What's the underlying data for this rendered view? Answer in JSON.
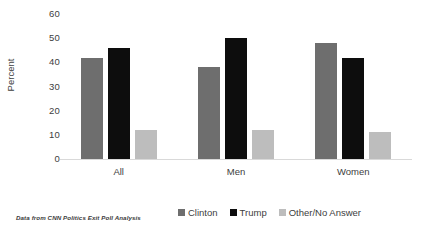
{
  "chart_data": {
    "type": "bar",
    "title": "",
    "subtitle": "",
    "xlabel": "",
    "ylabel": "Percent",
    "categories": [
      "All",
      "Men",
      "Women"
    ],
    "series": [
      {
        "name": "Clinton",
        "color": "#6e6e6e",
        "values": [
          42,
          38,
          48
        ]
      },
      {
        "name": "Trump",
        "color": "#0d0d0d",
        "values": [
          46,
          50,
          42
        ]
      },
      {
        "name": "Other/No Answer",
        "color": "#bdbdbd",
        "values": [
          12,
          12,
          11
        ]
      }
    ],
    "ylim": [
      0,
      60
    ],
    "yticks": [
      "0",
      "10",
      "20",
      "30",
      "40",
      "50",
      "60"
    ],
    "ytick_values": [
      0,
      10,
      20,
      30,
      40,
      50,
      60
    ],
    "grid": false,
    "legend_position": "bottom"
  },
  "source_note": "Data from CNN Politics Exit Poll Analysis",
  "colors": {
    "clinton": "#6e6e6e",
    "trump": "#0d0d0d",
    "other": "#bdbdbd",
    "axis": "#d9d9d9",
    "text": "#404040",
    "background": "#ffffff"
  }
}
